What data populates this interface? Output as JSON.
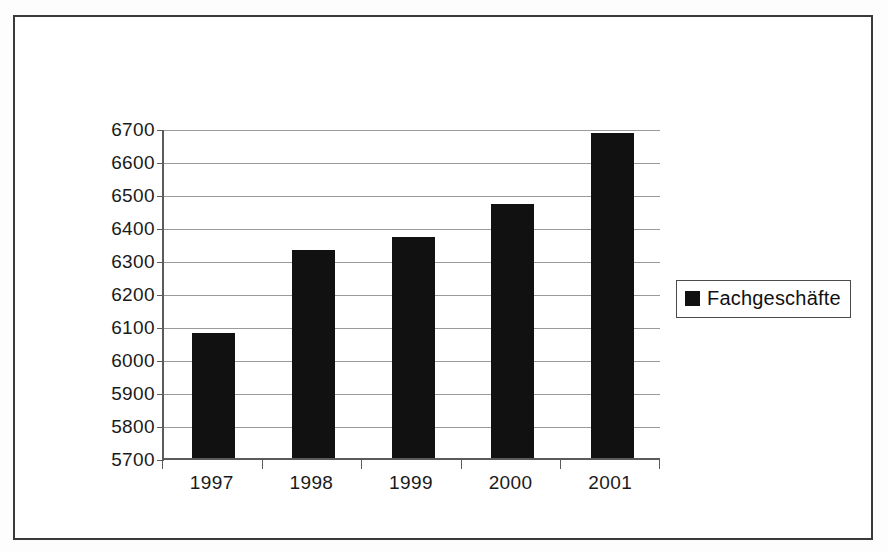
{
  "figure": {
    "frame_border_color": "#3a3a3a",
    "background": "#ffffff"
  },
  "chart_data": {
    "type": "bar",
    "title": "",
    "subtitle": "",
    "xlabel": "",
    "ylabel": "",
    "categories": [
      "1997",
      "1998",
      "1999",
      "2000",
      "2001"
    ],
    "values": [
      6080,
      6330,
      6370,
      6470,
      6685
    ],
    "series": [
      {
        "name": "Fachgeschäfte",
        "color": "#111111",
        "values": [
          6080,
          6330,
          6370,
          6470,
          6685
        ]
      }
    ],
    "ylim": [
      5700,
      6700
    ],
    "ytick_step": 100,
    "ytick_labels": [
      "6700",
      "6600",
      "6500",
      "6400",
      "6300",
      "6200",
      "6100",
      "6000",
      "5900",
      "5800",
      "5700"
    ],
    "ytick_values": [
      6700,
      6600,
      6500,
      6400,
      6300,
      6200,
      6100,
      6000,
      5900,
      5800,
      5700
    ],
    "grid": true,
    "grid_axis": "y",
    "grid_color": "#9a9a9a",
    "axis_color": "#5b5b5b",
    "legend_position": "right",
    "bar_color": "#111111"
  },
  "legend": {
    "entries": [
      {
        "label": "Fachgeschäfte",
        "color": "#111111",
        "marker": "square-marker"
      }
    ]
  }
}
